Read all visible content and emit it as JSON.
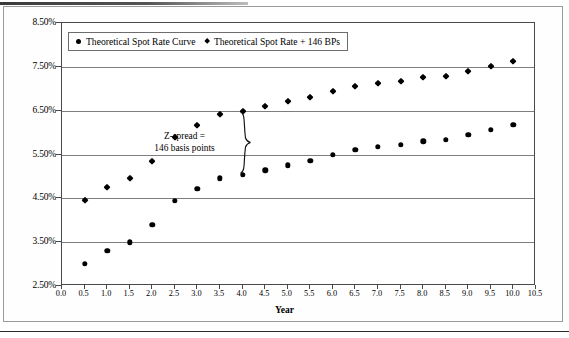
{
  "chart_data": {
    "type": "scatter",
    "title": "",
    "xlabel": "Year",
    "ylabel": "",
    "xlim": [
      0.0,
      10.5
    ],
    "ylim": [
      2.5,
      8.5
    ],
    "grid": true,
    "legend_position": "top-left",
    "x_ticks": [
      "0.0",
      "0.5",
      "1.0",
      "1.5",
      "2.0",
      "2.5",
      "3.0",
      "3.5",
      "4.0",
      "4.5",
      "5.0",
      "5.5",
      "6.0",
      "6.5",
      "7.0",
      "7.5",
      "8.0",
      "8.5",
      "9.0",
      "9.5",
      "10.0",
      "10.5"
    ],
    "x_tick_values": [
      0.0,
      0.5,
      1.0,
      1.5,
      2.0,
      2.5,
      3.0,
      3.5,
      4.0,
      4.5,
      5.0,
      5.5,
      6.0,
      6.5,
      7.0,
      7.5,
      8.0,
      8.5,
      9.0,
      9.5,
      10.0,
      10.5
    ],
    "y_ticks": [
      "2.50%",
      "3.50%",
      "4.50%",
      "5.50%",
      "6.50%",
      "7.50%",
      "8.50%"
    ],
    "y_tick_values": [
      2.5,
      3.5,
      4.5,
      5.5,
      6.5,
      7.5,
      8.5
    ],
    "x": [
      0.5,
      1.0,
      1.5,
      2.0,
      2.5,
      3.0,
      3.5,
      4.0,
      4.5,
      5.0,
      5.5,
      6.0,
      6.5,
      7.0,
      7.5,
      8.0,
      8.5,
      9.0,
      9.5,
      10.0
    ],
    "series": [
      {
        "name": "Theoretical Spot Rate Curve",
        "marker": "circle",
        "values": [
          3.0,
          3.3,
          3.5,
          3.9,
          4.44,
          4.72,
          4.96,
          5.04,
          5.14,
          5.25,
          5.36,
          5.5,
          5.61,
          5.67,
          5.72,
          5.8,
          5.84,
          5.95,
          6.06,
          6.18
        ]
      },
      {
        "name": "Theoretical Spot Rate + 146 BPs",
        "marker": "diamond",
        "values": [
          4.46,
          4.76,
          4.96,
          5.36,
          5.9,
          6.18,
          6.42,
          6.5,
          6.6,
          6.71,
          6.82,
          6.96,
          7.07,
          7.13,
          7.18,
          7.26,
          7.3,
          7.41,
          7.52,
          7.64
        ]
      }
    ],
    "annotations": [
      {
        "name": "z-spread-annotation",
        "line1": "Z-spread =",
        "line2": "146 basis points",
        "at_x": 4.0,
        "from_y": 5.04,
        "to_y": 6.5
      }
    ],
    "colors": {
      "marker": "#000000",
      "gridline": "#7d7d7d",
      "axis": "#4a4a4a",
      "background": "#ffffff"
    }
  }
}
